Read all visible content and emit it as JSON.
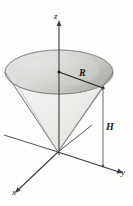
{
  "figure": {
    "type": "3d-geometry-diagram",
    "background_color": "#fdfdfc",
    "labels": {
      "z_axis": "z",
      "y_axis": "y",
      "x_axis": "x",
      "radius": "R",
      "height": "H"
    },
    "colors": {
      "axis_line": "#3d3d3d",
      "outline": "#6e6e6e",
      "cone_body_fill": "#f0f0ee",
      "cap_fill_light": "#dcdcda",
      "cap_fill_dark": "#b9b9b6",
      "label_text": "#1a1a1a"
    },
    "geometry": {
      "origin": [
        58,
        152
      ],
      "cap_center": [
        59,
        72
      ],
      "cap_rx": 54,
      "cap_ry": 22,
      "radius_endpoint": [
        103,
        88
      ],
      "height_foot": [
        103,
        162
      ],
      "z_axis_top": [
        59,
        24
      ],
      "y_axis_end": [
        120,
        172
      ],
      "x_axis_end": [
        14,
        195
      ]
    }
  }
}
